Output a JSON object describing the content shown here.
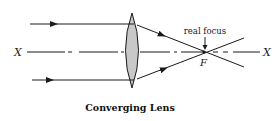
{
  "diagram": {
    "title": "Converging Lens",
    "axis": {
      "left_label": "X",
      "right_label": "X"
    },
    "focus": {
      "point_label": "F",
      "annotation": "real focus"
    },
    "colors": {
      "lens_fill": "#c8c8c8",
      "stroke": "#1a1a1a"
    }
  }
}
